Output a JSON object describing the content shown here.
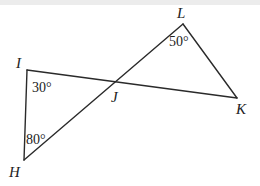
{
  "diagram": {
    "type": "geometry",
    "points": {
      "I": {
        "label": "I",
        "x": 27,
        "y": 70
      },
      "H": {
        "label": "H",
        "x": 24,
        "y": 160
      },
      "J": {
        "label": "J",
        "x": 116,
        "y": 84
      },
      "L": {
        "label": "L",
        "x": 183,
        "y": 24
      },
      "K": {
        "label": "K",
        "x": 237,
        "y": 98
      }
    },
    "segments": [
      [
        "I",
        "K"
      ],
      [
        "H",
        "L"
      ],
      [
        "I",
        "H"
      ],
      [
        "L",
        "K"
      ]
    ],
    "angles": {
      "I": "30°",
      "H": "80°",
      "L": "50°"
    },
    "colors": {
      "stroke": "#2a2a2a",
      "text": "#222222",
      "background": "#ffffff"
    }
  }
}
